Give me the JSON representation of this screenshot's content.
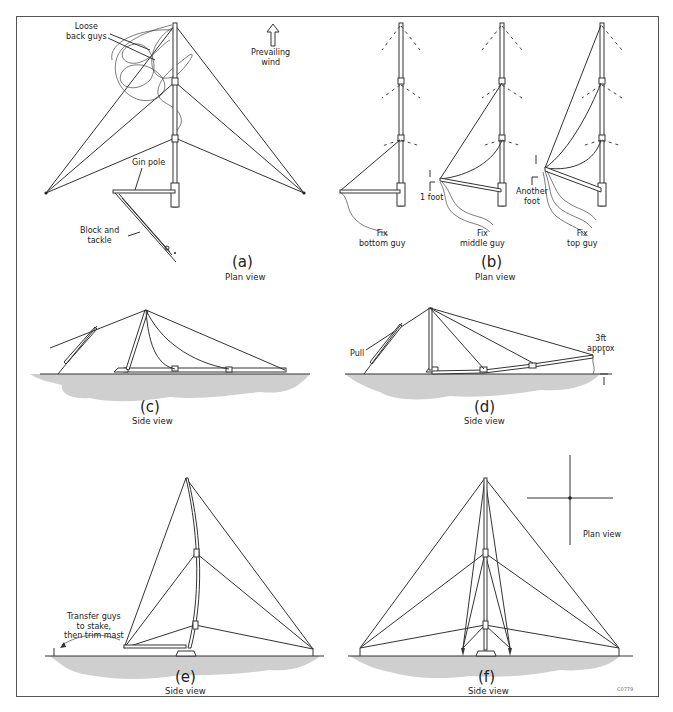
{
  "figure": {
    "id_code": "C0779",
    "panels": [
      {
        "id": "a",
        "caption": "(a)",
        "view": "Plan view",
        "labels": {
          "loose_back_guys": "Loose\nback guys",
          "prevailing_wind": "Prevailing\nwind",
          "gin_pole": "Gin pole",
          "block_and_tackle": "Block and\ntackle"
        }
      },
      {
        "id": "b",
        "caption": "(b)",
        "view": "Plan view",
        "labels": {
          "fix_bottom": "Fix\nbottom guy",
          "fix_middle": "Fix\nmiddle guy",
          "fix_top": "Fix\ntop guy",
          "one_foot": "1 foot",
          "another_foot": "Another\nfoot"
        }
      },
      {
        "id": "c",
        "caption": "(c)",
        "view": "Side view",
        "labels": {}
      },
      {
        "id": "d",
        "caption": "(d)",
        "view": "Side view",
        "labels": {
          "pull": "Pull",
          "three_ft": "3ft\napprox"
        }
      },
      {
        "id": "e",
        "caption": "(e)",
        "view": "Side view",
        "labels": {
          "transfer": "Transfer guys\nto stake,\nthen trim mast"
        }
      },
      {
        "id": "f",
        "caption": "(f)",
        "view": "Side view",
        "labels": {
          "plan_view_inset": "Plan view"
        }
      }
    ]
  }
}
